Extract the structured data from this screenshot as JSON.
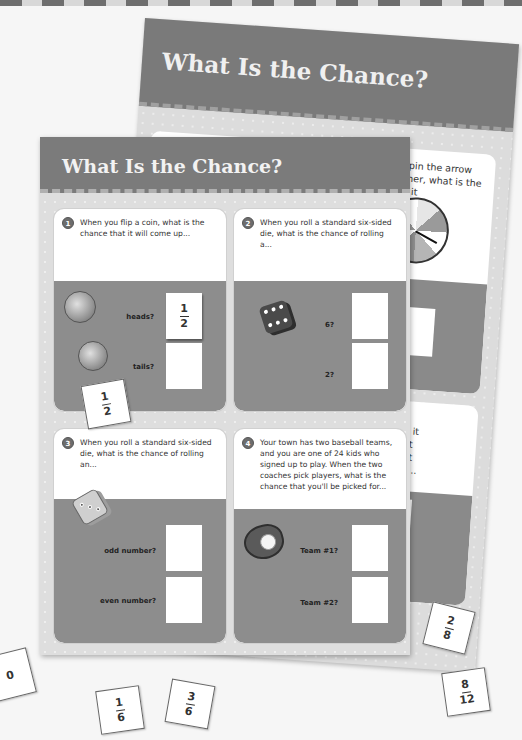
{
  "worksheet": {
    "title": "What Is the Chance?",
    "questions": [
      {
        "number": "1",
        "text": "When you flip a coin, what is the chance that it will come up...",
        "answers": [
          {
            "label": "heads?",
            "value": {
              "n": "1",
              "d": "2"
            }
          },
          {
            "label": "tails?",
            "value": null
          }
        ],
        "image": "coin-icon"
      },
      {
        "number": "2",
        "text": "When you roll a standard six-sided die, what is the chance of rolling a...",
        "answers": [
          {
            "label": "6?",
            "value": null
          },
          {
            "label": "2?",
            "value": null
          }
        ],
        "image": "die-icon"
      },
      {
        "number": "3",
        "text": "When you roll a standard six-sided die, what is the chance of rolling an...",
        "answers": [
          {
            "label": "odd number?",
            "value": null
          },
          {
            "label": "even number?",
            "value": null
          }
        ],
        "image": "die-icon"
      },
      {
        "number": "4",
        "text": "Your town has two baseball teams, and you are one of 24 kids who signed up to play. When the two coaches pick players, what is the chance that you'll be picked for...",
        "answers": [
          {
            "label": "Team #1?",
            "value": null
          },
          {
            "label": "Team #2?",
            "value": null
          }
        ],
        "image": "baseball-glove-icon"
      }
    ]
  },
  "back_worksheet": {
    "title": "What Is the Chance?",
    "questions": [
      {
        "number": "5",
        "text": "When you spin the arrow on this spinner, what is the chance that it will stop on..."
      },
      {
        "number": "6",
        "text": "When you spin the arrow on this spinner, what is the chance that it"
      },
      {
        "number": "7",
        "text_fragment": "as 4 red\narbles in it\ng without\nance that\nle that is..."
      }
    ],
    "partial_label": "e?"
  },
  "loose_tiles": [
    {
      "kind": "fraction",
      "n": "1",
      "d": "2"
    },
    {
      "kind": "whole",
      "value": "0"
    },
    {
      "kind": "fraction",
      "n": "1",
      "d": "6"
    },
    {
      "kind": "fraction",
      "n": "3",
      "d": "6"
    },
    {
      "kind": "fraction",
      "n": "2",
      "d": "8"
    },
    {
      "kind": "fraction",
      "n": "8",
      "d": "12"
    }
  ]
}
